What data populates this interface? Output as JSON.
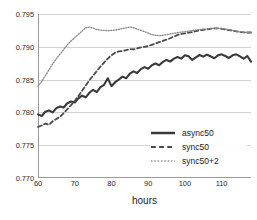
{
  "chart_data": {
    "type": "line",
    "title": "",
    "xlabel": "hours",
    "ylabel": "",
    "xlim": [
      60,
      118
    ],
    "ylim": [
      0.77,
      0.795
    ],
    "grid": true,
    "legend_position": "inside-bottom-right",
    "x_ticks": [
      "60",
      "70",
      "80",
      "90",
      "100",
      "110"
    ],
    "x_tick_values": [
      60,
      70,
      80,
      90,
      100,
      110
    ],
    "y_ticks": [
      "0.770",
      "0.775",
      "0.780",
      "0.785",
      "0.790",
      "0.795"
    ],
    "y_tick_values": [
      0.77,
      0.775,
      0.78,
      0.785,
      0.79,
      0.795
    ],
    "x": [
      60,
      61,
      62,
      63,
      64,
      65,
      66,
      67,
      68,
      69,
      70,
      71,
      72,
      73,
      74,
      75,
      76,
      77,
      78,
      79,
      80,
      81,
      82,
      83,
      84,
      85,
      86,
      87,
      88,
      89,
      90,
      91,
      92,
      93,
      94,
      95,
      96,
      97,
      98,
      99,
      100,
      101,
      102,
      103,
      104,
      105,
      106,
      107,
      108,
      109,
      110,
      111,
      112,
      113,
      114,
      115,
      116,
      117,
      118
    ],
    "series": [
      {
        "name": "async50",
        "style": "solid",
        "color": "#3a3a3a",
        "width": 2.1,
        "values": [
          0.7797,
          0.77945,
          0.7801,
          0.7803,
          0.78,
          0.78065,
          0.7809,
          0.78075,
          0.7814,
          0.78165,
          0.7815,
          0.78215,
          0.78255,
          0.7823,
          0.783,
          0.78345,
          0.7831,
          0.78385,
          0.7842,
          0.7852,
          0.784,
          0.7846,
          0.785,
          0.78545,
          0.7852,
          0.7859,
          0.78625,
          0.786,
          0.7866,
          0.7869,
          0.78665,
          0.7872,
          0.78745,
          0.7872,
          0.7877,
          0.788,
          0.78775,
          0.7882,
          0.78845,
          0.7882,
          0.7887,
          0.78855,
          0.788,
          0.7884,
          0.78875,
          0.7885,
          0.7888,
          0.78855,
          0.78825,
          0.7887,
          0.78885,
          0.7886,
          0.7883,
          0.7887,
          0.78885,
          0.78855,
          0.7882,
          0.7886,
          0.78775
        ]
      },
      {
        "name": "sync50",
        "style": "dashed",
        "color": "#4a4a4a",
        "width": 1.8,
        "values": [
          0.7778,
          0.778,
          0.7783,
          0.7781,
          0.77865,
          0.779,
          0.77935,
          0.7799,
          0.7805,
          0.7811,
          0.78175,
          0.7825,
          0.7833,
          0.7841,
          0.7849,
          0.7856,
          0.7863,
          0.787,
          0.7876,
          0.7882,
          0.7887,
          0.7891,
          0.7893,
          0.78935,
          0.7895,
          0.78965,
          0.7896,
          0.78975,
          0.7899,
          0.79,
          0.7901,
          0.7903,
          0.7905,
          0.7907,
          0.7909,
          0.7911,
          0.7913,
          0.79155,
          0.7918,
          0.79195,
          0.79205,
          0.79215,
          0.79225,
          0.7924,
          0.7925,
          0.7926,
          0.79265,
          0.79275,
          0.7928,
          0.7928,
          0.79275,
          0.79265,
          0.79255,
          0.79245,
          0.79235,
          0.79225,
          0.7922,
          0.79218,
          0.79218
        ]
      },
      {
        "name": "sync50+2",
        "style": "dotted",
        "color": "#8a8a8a",
        "width": 1.3,
        "values": [
          0.784,
          0.7847,
          0.7856,
          0.7865,
          0.7874,
          0.7882,
          0.7889,
          0.7896,
          0.7903,
          0.7909,
          0.7914,
          0.7919,
          0.7924,
          0.7929,
          0.793,
          0.79285,
          0.79265,
          0.79255,
          0.7925,
          0.79245,
          0.7925,
          0.79255,
          0.79265,
          0.7928,
          0.7929,
          0.793,
          0.7929,
          0.7927,
          0.7925,
          0.7923,
          0.7921,
          0.79185,
          0.79175,
          0.7917,
          0.79175,
          0.79185,
          0.79195,
          0.79205,
          0.79215,
          0.79225,
          0.7923,
          0.7924,
          0.7925,
          0.79258,
          0.79262,
          0.79268,
          0.79272,
          0.79278,
          0.79282,
          0.79282,
          0.79278,
          0.7927,
          0.7926,
          0.7925,
          0.7924,
          0.7923,
          0.79222,
          0.79218,
          0.79218
        ]
      }
    ],
    "legend": [
      {
        "label": "async50",
        "style": "solid"
      },
      {
        "label": "sync50",
        "style": "dashed"
      },
      {
        "label": "sync50+2",
        "style": "dotted"
      }
    ]
  }
}
